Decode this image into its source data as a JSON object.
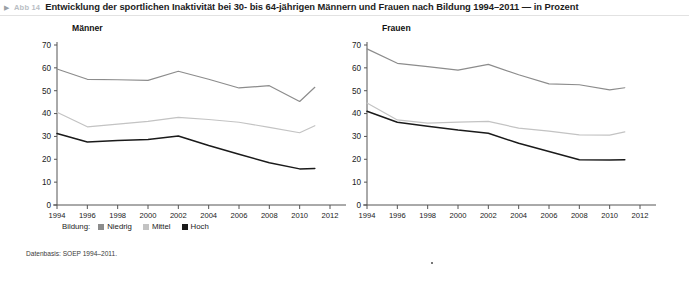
{
  "figure": {
    "marker": "▶",
    "number": "Abb 14",
    "title": "Entwicklung der sportlichen Inaktivität bei 30- bis 64-jährigen Männern und Frauen nach Bildung 1994–2011 — in Prozent",
    "source": "Datenbasis: SOEP 1994–2011."
  },
  "legend": {
    "title": "Bildung:",
    "items": [
      {
        "label": "Niedrig",
        "color": "#8c8c8c"
      },
      {
        "label": "Mittel",
        "color": "#c3c3c3"
      },
      {
        "label": "Hoch",
        "color": "#1a1a1a"
      }
    ]
  },
  "axis": {
    "y_ticks": [
      "0",
      "10",
      "20",
      "30",
      "40",
      "50",
      "60",
      "70"
    ],
    "x_ticks": [
      "1994",
      "1996",
      "1998",
      "2000",
      "2002",
      "2004",
      "2006",
      "2008",
      "2010",
      "2012"
    ]
  },
  "chart_data": [
    {
      "type": "line",
      "title": "Männer",
      "xlabel": "",
      "ylabel": "",
      "xlim": [
        1994,
        2012
      ],
      "ylim": [
        0,
        70
      ],
      "grid": false,
      "legend_position": "bottom",
      "x": [
        1994,
        1996,
        1998,
        2000,
        2002,
        2004,
        2006,
        2008,
        2010,
        2011
      ],
      "series": [
        {
          "name": "Niedrig",
          "color": "#8c8c8c",
          "values": [
            59.5,
            55.0,
            54.8,
            54.5,
            58.5,
            55.0,
            51.2,
            52.2,
            45.3,
            51.5
          ]
        },
        {
          "name": "Mittel",
          "color": "#c3c3c3",
          "values": [
            40.6,
            34.2,
            35.4,
            36.6,
            38.3,
            37.4,
            36.2,
            34.0,
            31.6,
            34.7
          ]
        },
        {
          "name": "Hoch",
          "color": "#1a1a1a",
          "values": [
            31.3,
            27.6,
            28.2,
            28.7,
            30.2,
            26.0,
            22.2,
            18.5,
            15.8,
            16.0
          ]
        }
      ]
    },
    {
      "type": "line",
      "title": "Frauen",
      "xlabel": "",
      "ylabel": "",
      "xlim": [
        1994,
        2012
      ],
      "ylim": [
        0,
        70
      ],
      "grid": false,
      "legend_position": "bottom",
      "x": [
        1994,
        1996,
        1998,
        2000,
        2002,
        2004,
        2006,
        2008,
        2010,
        2011
      ],
      "series": [
        {
          "name": "Niedrig",
          "color": "#8c8c8c",
          "values": [
            68.3,
            62.0,
            60.5,
            59.0,
            61.5,
            57.0,
            53.0,
            52.6,
            50.4,
            51.3
          ]
        },
        {
          "name": "Mittel",
          "color": "#c3c3c3",
          "values": [
            44.6,
            37.2,
            35.8,
            36.3,
            36.6,
            33.6,
            32.3,
            30.7,
            30.6,
            32.0
          ]
        },
        {
          "name": "Hoch",
          "color": "#1a1a1a",
          "values": [
            41.0,
            36.2,
            34.5,
            32.8,
            31.4,
            27.0,
            23.4,
            19.8,
            19.7,
            19.8
          ]
        }
      ]
    }
  ]
}
